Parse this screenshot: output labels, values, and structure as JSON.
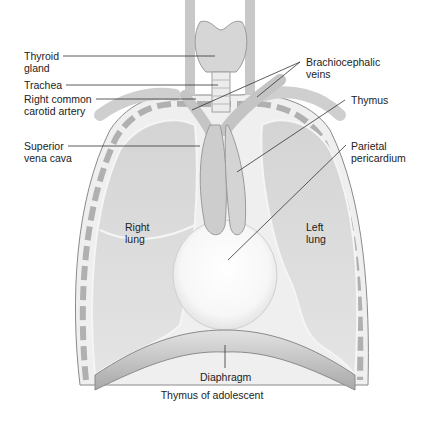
{
  "figure": {
    "caption": "Thymus of adolescent",
    "style": "grayscale anatomical illustration",
    "colors": {
      "background": "#ffffff",
      "tissue_light": "#e6e6e6",
      "tissue_mid": "#cfcfcf",
      "tissue_dark": "#9a9a9a",
      "outline": "#8a8a8a",
      "leader_line": "#333333",
      "label_text": "#222222"
    }
  },
  "labels": {
    "thyroid_gland": [
      "Thyroid",
      "gland"
    ],
    "trachea": [
      "Trachea"
    ],
    "right_common_carotid_artery": [
      "Right common",
      "carotid artery"
    ],
    "superior_vena_cava": [
      "Superior",
      "vena cava"
    ],
    "brachiocephalic_veins": [
      "Brachiocephalic",
      "veins"
    ],
    "thymus": [
      "Thymus"
    ],
    "parietal_pericardium": [
      "Parietal",
      "pericardium"
    ],
    "right_lung": [
      "Right",
      "lung"
    ],
    "left_lung": [
      "Left",
      "lung"
    ],
    "diaphragm": [
      "Diaphragm"
    ]
  }
}
